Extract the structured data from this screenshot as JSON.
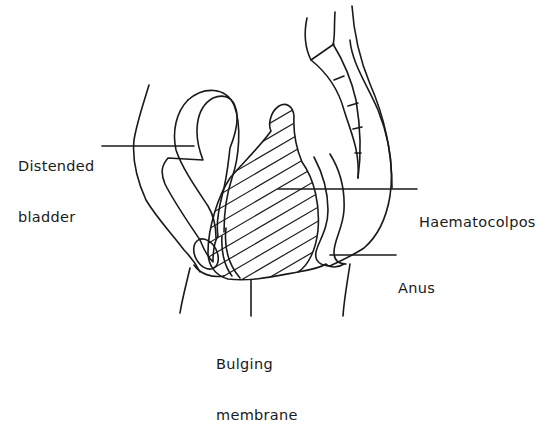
{
  "diagram": {
    "type": "anatomical-sagittal-section",
    "background": "#ffffff",
    "stroke_color": "#1a1a1a",
    "labels": [
      {
        "id": "distended-bladder",
        "lines": [
          "Distended",
          "bladder"
        ]
      },
      {
        "id": "haematocolpos",
        "lines": [
          "Haematocolpos"
        ]
      },
      {
        "id": "anus",
        "lines": [
          "Anus"
        ]
      },
      {
        "id": "bulging-membrane",
        "lines": [
          "Bulging",
          "membrane"
        ]
      }
    ]
  }
}
